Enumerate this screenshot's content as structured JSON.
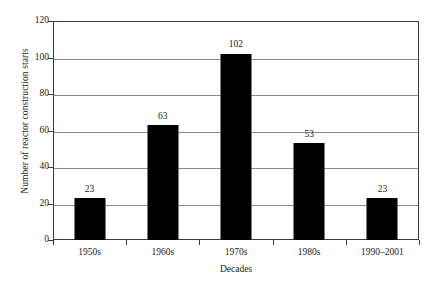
{
  "chart_data": {
    "type": "bar",
    "title": "",
    "categories": [
      "1950s",
      "1960s",
      "1970s",
      "1980s",
      "1990–2001"
    ],
    "values": [
      23,
      63,
      102,
      53,
      23
    ],
    "value_labels": [
      "23",
      "63",
      "102",
      "53",
      "23"
    ],
    "xlabel": "Decades",
    "ylabel": "Number of reactor construction starts",
    "ylim": [
      0,
      120
    ],
    "yticks": [
      0,
      20,
      40,
      60,
      80,
      100,
      120
    ],
    "ytick_labels": [
      "0",
      "20",
      "40",
      "60",
      "80",
      "100",
      "120"
    ],
    "grid": "horizontal",
    "legend": "none",
    "bar_color": "#000000",
    "gridline_color": "#8c8c8c",
    "axis_color": "#3a3a3a",
    "background_color": "#ffffff"
  }
}
